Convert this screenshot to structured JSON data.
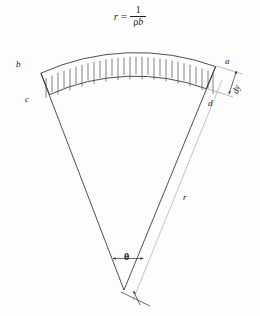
{
  "figure": {
    "title_formula": {
      "lhs": "r",
      "equals": "=",
      "numerator": "1",
      "denominator_rho": "ρ",
      "denominator_b": "b",
      "plain": "r = 1/(ρb)"
    },
    "labels": {
      "a": "a",
      "b": "b",
      "c": "c",
      "d": "d",
      "dy": "dy",
      "r": "r",
      "theta": "θ"
    },
    "colors": {
      "background": "#fdfdfd",
      "stroke": "#3b3b3b",
      "stroke_light": "#9a9a9a",
      "text": "#151515"
    },
    "geometry": {
      "apex_x": 124,
      "apex_y": 290,
      "outer_radius": 232,
      "inner_radius": 208,
      "start_angle_deg": 249,
      "end_angle_deg": 291,
      "hatch_count": 30
    }
  }
}
